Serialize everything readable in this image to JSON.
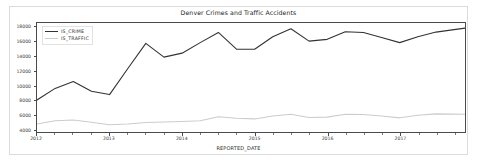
{
  "figure": {
    "title": "Denver Crimes and Traffic Accidents",
    "xaxis_label": "REPORTED_DATE",
    "background_color": "#ffffff",
    "border_color": "#dcdcdc"
  },
  "legend": {
    "entries": [
      {
        "label": "IS_CRIME",
        "color": "#333333"
      },
      {
        "label": "IS_TRAFFIC",
        "color": "#cccccc"
      }
    ]
  },
  "axes": {
    "y_ticks": [
      "4000",
      "6000",
      "8000",
      "10000",
      "12000",
      "14000",
      "16000",
      "18000"
    ],
    "x_ticks": [
      "2012",
      "2013",
      "2014",
      "2015",
      "2016",
      "2017"
    ]
  },
  "chart_data": {
    "type": "line",
    "title": "Denver Crimes and Traffic Accidents",
    "xlabel": "REPORTED_DATE",
    "ylabel": "",
    "xlim": [
      2012.0,
      2017.9
    ],
    "ylim": [
      3600,
      18600
    ],
    "y_ticks": [
      4000,
      6000,
      8000,
      10000,
      12000,
      14000,
      16000,
      18000
    ],
    "x_ticks": [
      2012,
      2013,
      2014,
      2015,
      2016,
      2017
    ],
    "grid": false,
    "legend_position": "upper left",
    "x": [
      2012.0,
      2012.25,
      2012.5,
      2012.75,
      2013.0,
      2013.25,
      2013.5,
      2013.75,
      2014.0,
      2014.25,
      2014.5,
      2014.75,
      2015.0,
      2015.25,
      2015.5,
      2015.75,
      2016.0,
      2016.25,
      2016.5,
      2016.75,
      2017.0,
      2017.25,
      2017.5,
      2017.9
    ],
    "series": [
      {
        "name": "IS_CRIME",
        "color": "#333333",
        "values": [
          8000,
          9600,
          10550,
          9200,
          8750,
          12300,
          15800,
          13900,
          14450,
          15900,
          17300,
          15000,
          14980,
          16700,
          17800,
          16100,
          16350,
          17400,
          17300,
          16600,
          15900,
          16700,
          17350,
          17900
        ]
      },
      {
        "name": "IS_TRAFFIC",
        "color": "#cccccc",
        "values": [
          4700,
          5150,
          5250,
          4950,
          4600,
          4700,
          4900,
          4980,
          5050,
          5150,
          5700,
          5500,
          5400,
          5800,
          6050,
          5600,
          5650,
          6050,
          6000,
          5800,
          5550,
          5900,
          6100,
          6050
        ]
      }
    ]
  }
}
